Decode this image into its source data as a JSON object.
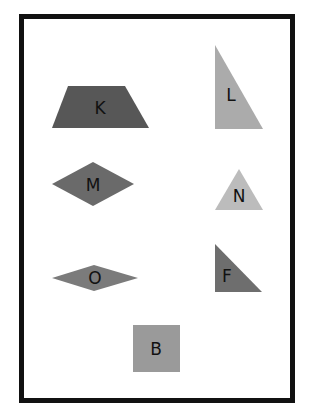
{
  "figure": {
    "frame": {
      "border_color": "#111111"
    },
    "shapes": [
      {
        "label": "K",
        "type": "trapezoid",
        "color": "#575757"
      },
      {
        "label": "L",
        "type": "right-triangle",
        "color": "#ababab"
      },
      {
        "label": "M",
        "type": "rhombus",
        "color": "#6a6a6a"
      },
      {
        "label": "N",
        "type": "isosceles-triangle",
        "color": "#bcbcbc"
      },
      {
        "label": "O",
        "type": "flat-rhombus",
        "color": "#7b7b7b"
      },
      {
        "label": "F",
        "type": "right-triangle",
        "color": "#6e6e6e"
      },
      {
        "label": "B",
        "type": "square",
        "color": "#9a9a9a"
      }
    ]
  }
}
